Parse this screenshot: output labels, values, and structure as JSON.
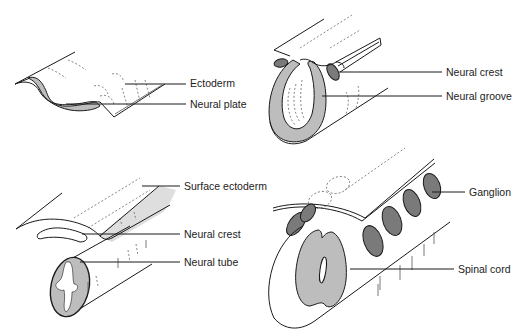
{
  "figure": {
    "colors": {
      "neural_tissue": "#bdbdbd",
      "crest_ganglion": "#7a7a7a",
      "outline": "#1a1a1a",
      "surface": "#ffffff",
      "shadow": "#dedede"
    },
    "panels": [
      {
        "id": "top-left",
        "labels": [
          {
            "text": "Ectoderm",
            "x": 190,
            "y": 77
          },
          {
            "text": "Neural plate",
            "x": 190,
            "y": 99
          }
        ]
      },
      {
        "id": "top-right",
        "labels": [
          {
            "text": "Neural crest",
            "x": 446,
            "y": 67
          },
          {
            "text": "Neural groove",
            "x": 446,
            "y": 91
          }
        ]
      },
      {
        "id": "bottom-left",
        "labels": [
          {
            "text": "Surface ectoderm",
            "x": 184,
            "y": 181
          },
          {
            "text": "Neural crest",
            "x": 184,
            "y": 230
          },
          {
            "text": "Neural tube",
            "x": 184,
            "y": 257
          }
        ]
      },
      {
        "id": "bottom-right",
        "labels": [
          {
            "text": "Ganglion",
            "x": 469,
            "y": 186
          },
          {
            "text": "Spinal cord",
            "x": 458,
            "y": 263
          }
        ]
      }
    ]
  }
}
